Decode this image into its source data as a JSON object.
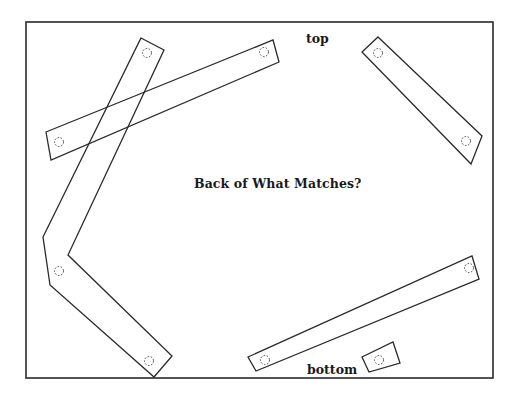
{
  "diagram": {
    "title": "Back of What Matches?",
    "labels": {
      "top": "top",
      "bottom": "bottom"
    },
    "colors": {
      "background": "#ffffff",
      "stroke": "#2a2a2a",
      "text": "#1a1a1a"
    },
    "frame": {
      "x": 26,
      "y": 22,
      "width": 467,
      "height": 356
    },
    "pieces": [
      {
        "name": "bent-strip-left",
        "points": "141,38 164,50 68,255 172,356 154,377 50,285 43,237",
        "holes": [
          [
            147,
            53
          ],
          [
            59,
            271
          ],
          [
            149,
            361
          ]
        ]
      },
      {
        "name": "strip-upper-diagonal",
        "points": "46,132 273,40 279,62 51,160",
        "holes": [
          [
            59,
            142
          ],
          [
            264,
            52
          ]
        ]
      },
      {
        "name": "strip-upper-right",
        "points": "378,37 482,136 471,164 362,52",
        "holes": [
          [
            378,
            53
          ],
          [
            466,
            141
          ]
        ]
      },
      {
        "name": "strip-bottom",
        "points": "248,357 472,256 479,279 256,371",
        "holes": [
          [
            265,
            360
          ],
          [
            469,
            268
          ]
        ]
      },
      {
        "name": "small-square",
        "points": "362,357 393,342 400,363 369,372",
        "holes": [
          [
            379,
            360
          ]
        ]
      }
    ]
  }
}
